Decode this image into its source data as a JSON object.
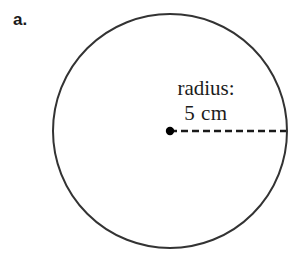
{
  "figure": {
    "part_label": "a.",
    "shape": {
      "name": "circle",
      "stroke_color": "#333333",
      "fill_color": "#ffffff",
      "stroke_width": 2,
      "center_x": 170,
      "center_y": 131,
      "radius_px": 117
    },
    "center_point": {
      "name": "center-dot",
      "color": "#000000",
      "radius_px": 4
    },
    "radius_line": {
      "name": "radius-dashed-line",
      "style": "dashed",
      "color": "#1a1a1a",
      "dash_length": 7,
      "gap_length": 4,
      "from_x": 170,
      "to_x": 286,
      "y": 131
    },
    "annotation": {
      "line1": "radius:",
      "line2": "5 cm",
      "value": "5",
      "unit": "cm",
      "text_color": "#1c1c1c"
    }
  }
}
